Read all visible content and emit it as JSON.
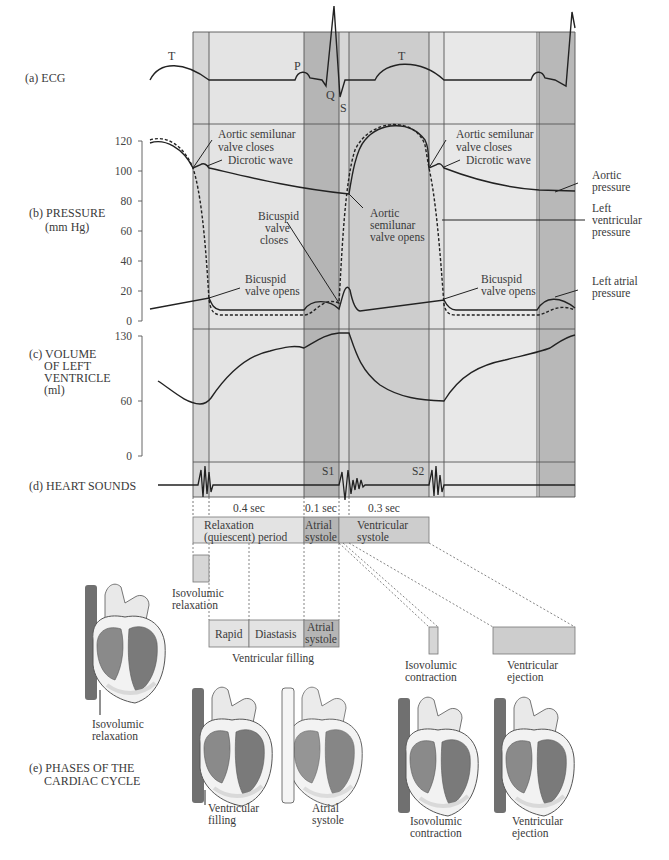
{
  "figure": {
    "panels": {
      "ecg": {
        "label": "(a) ECG",
        "waves": {
          "t1": "T",
          "p": "P",
          "q": "Q",
          "s": "S",
          "t2": "T"
        }
      },
      "pressure": {
        "label_line1": "(b) PRESSURE",
        "label_line2": "(mm Hg)",
        "ticks": [
          "120",
          "100",
          "80",
          "60",
          "40",
          "20",
          "0"
        ],
        "annotations": {
          "aortic_closes_left": [
            "Aortic semilunar",
            "valve closes"
          ],
          "dicrotic_left": "Dicrotic wave",
          "bicuspid_closes": [
            "Bicuspid",
            "valve",
            "closes"
          ],
          "bicuspid_opens_left": [
            "Bicuspid",
            "valve opens"
          ],
          "aortic_opens": [
            "Aortic",
            "semilunar",
            "valve opens"
          ],
          "aortic_closes_right": [
            "Aortic semilunar",
            "valve closes"
          ],
          "dicrotic_right": "Dicrotic wave",
          "bicuspid_opens_right": [
            "Bicuspid",
            "valve opens"
          ]
        },
        "legend": {
          "aortic": [
            "Aortic",
            "pressure"
          ],
          "ventricular": [
            "Left",
            "ventricular",
            "pressure"
          ],
          "atrial": [
            "Left atrial",
            "pressure"
          ]
        }
      },
      "volume": {
        "label_lines": [
          "(c) VOLUME",
          "OF LEFT",
          "VENTRICLE",
          "(ml)"
        ],
        "ticks": [
          "130",
          "60",
          "0"
        ]
      },
      "sounds": {
        "label": "(d) HEART SOUNDS",
        "s1": "S1",
        "s2": "S2"
      }
    },
    "durations": [
      "0.4 sec",
      "0.1 sec",
      "0.3 sec"
    ],
    "periods": {
      "relaxation": [
        "Relaxation",
        "(quiescent) period"
      ],
      "atrial": [
        "Atrial",
        "systole"
      ],
      "ventricular": [
        "Ventricular",
        "systole"
      ]
    },
    "phases": {
      "isovolumic_relaxation": [
        "Isovolumic",
        "relaxation"
      ],
      "filling_boxes": [
        "Rapid",
        "Diastasis",
        "Atrial",
        "systole"
      ],
      "ventricular_filling": "Ventricular filling",
      "isovolumic_contraction": [
        "Isovolumic",
        "contraction"
      ],
      "ventricular_ejection": [
        "Ventricular",
        "ejection"
      ]
    },
    "section_e": [
      "(e) PHASES OF THE",
      "CARDIAC CYCLE"
    ],
    "heart_captions": {
      "h1": [
        "Isovolumic",
        "relaxation"
      ],
      "h2": [
        "Ventricular",
        "filling"
      ],
      "h3": [
        "Atrial",
        "systole"
      ],
      "h4": [
        "Isovolumic",
        "contraction"
      ],
      "h5": [
        "Ventricular",
        "ejection"
      ]
    },
    "colors": {
      "band_light": "#e3e3e3",
      "band_mid": "#d2d2d2",
      "band_dark": "#b4b4b4",
      "band_lighter": "#ececec",
      "line": "#222222",
      "heart_dark": "#6e6e6e",
      "heart_mid": "#8a8a8a",
      "heart_light": "#d9d9d9"
    }
  }
}
